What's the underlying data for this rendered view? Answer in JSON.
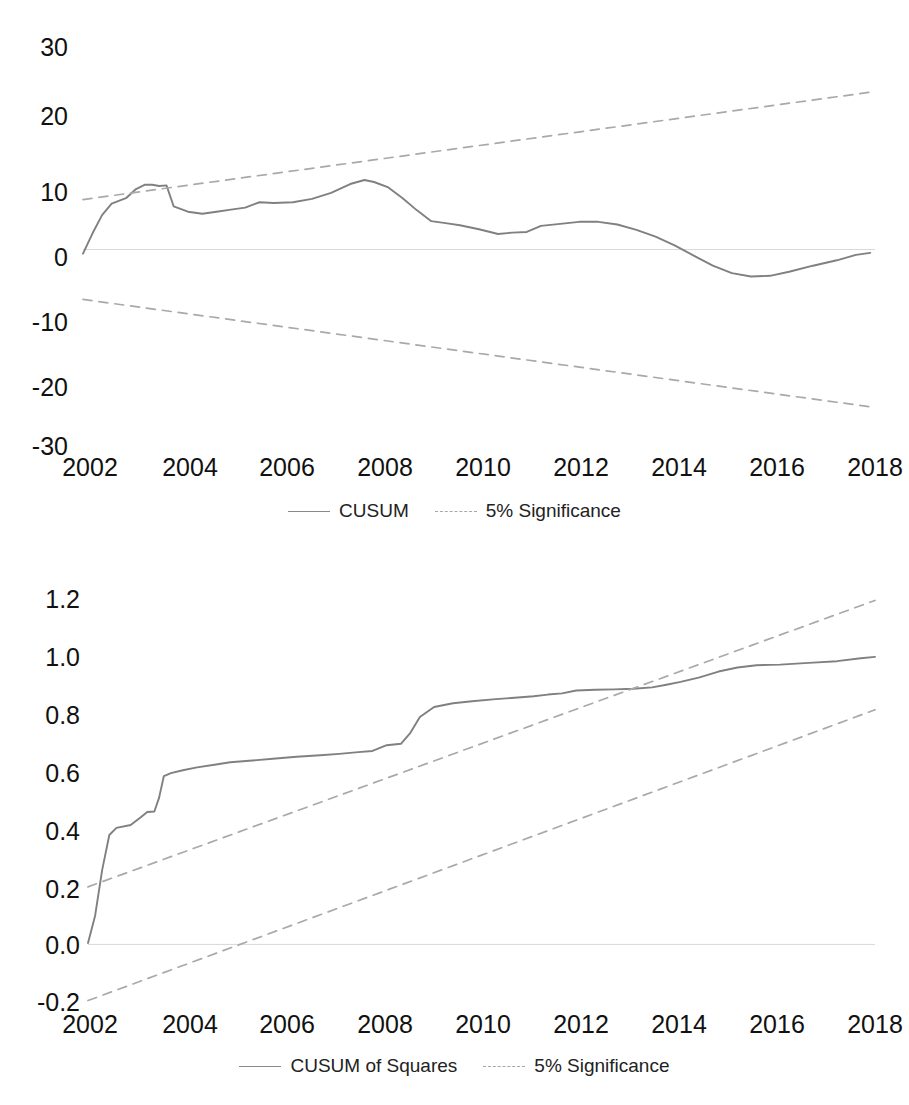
{
  "page": {
    "background": "#ffffff",
    "line_color": "#808080",
    "significance_color": "#a9a9a9",
    "zero_line_color": "#d9d9d9",
    "text_color": "#111111",
    "cropped_top_text": ""
  },
  "charts": [
    {
      "id": "cusum",
      "legend": [
        {
          "label": "CUSUM",
          "style": "solid",
          "color": "#808080"
        },
        {
          "label": "5% Significance",
          "style": "dashed",
          "color": "#a9a9a9"
        }
      ],
      "axes": {
        "y_ticks": [
          "30",
          "20",
          "10",
          "0",
          "-10",
          "-20",
          "-30"
        ],
        "x_ticks": [
          "2002",
          "2004",
          "2006",
          "2008",
          "2010",
          "2012",
          "2014",
          "2016",
          "2018"
        ]
      }
    },
    {
      "id": "cusum-of-squares",
      "legend": [
        {
          "label": "CUSUM of Squares",
          "style": "solid",
          "color": "#808080"
        },
        {
          "label": "5% Significance",
          "style": "dashed",
          "color": "#a9a9a9"
        }
      ],
      "axes": {
        "y_ticks": [
          "1.2",
          "1.0",
          "0.8",
          "0.6",
          "0.4",
          "0.2",
          "0.0",
          "-0.2"
        ],
        "x_ticks": [
          "2002",
          "2004",
          "2006",
          "2008",
          "2010",
          "2012",
          "2014",
          "2016",
          "2018"
        ]
      }
    }
  ],
  "chart_data": [
    {
      "type": "line",
      "title": "CUSUM",
      "xlabel": "",
      "ylabel": "",
      "xlim": [
        2002.0,
        2018.6
      ],
      "ylim": [
        -30,
        30
      ],
      "ytick_values": [
        30,
        20,
        10,
        0,
        -10,
        -20,
        -30
      ],
      "xtick_values": [
        2002,
        2004,
        2006,
        2008,
        2010,
        2012,
        2014,
        2016,
        2018
      ],
      "grid": false,
      "zero_line": true,
      "legend_position": "bottom",
      "series": [
        {
          "name": "CUSUM",
          "style": "solid",
          "color": "#808080",
          "x": [
            2002.0,
            2002.2,
            2002.4,
            2002.6,
            2002.9,
            2003.1,
            2003.3,
            2003.45,
            2003.6,
            2003.75,
            2003.9,
            2004.2,
            2004.5,
            2004.8,
            2005.1,
            2005.4,
            2005.7,
            2006.0,
            2006.4,
            2006.8,
            2007.2,
            2007.6,
            2007.9,
            2008.1,
            2008.4,
            2008.7,
            2009.0,
            2009.3,
            2009.6,
            2009.9,
            2010.3,
            2010.7,
            2011.0,
            2011.3,
            2011.6,
            2012.0,
            2012.4,
            2012.8,
            2013.2,
            2013.6,
            2014.0,
            2014.4,
            2014.8,
            2015.2,
            2015.6,
            2016.0,
            2016.4,
            2016.8,
            2017.3,
            2017.8,
            2018.2,
            2018.5
          ],
          "y": [
            -0.6,
            2.4,
            5.1,
            6.8,
            7.6,
            8.9,
            9.6,
            9.6,
            9.4,
            9.5,
            6.4,
            5.6,
            5.3,
            5.6,
            5.9,
            6.2,
            7.0,
            6.9,
            7.0,
            7.5,
            8.4,
            9.7,
            10.3,
            10.0,
            9.2,
            7.6,
            5.8,
            4.2,
            3.9,
            3.6,
            3.0,
            2.3,
            2.5,
            2.6,
            3.5,
            3.8,
            4.1,
            4.1,
            3.7,
            2.9,
            1.9,
            0.6,
            -0.9,
            -2.4,
            -3.5,
            -4.0,
            -3.9,
            -3.3,
            -2.4,
            -1.6,
            -0.8,
            -0.5
          ]
        },
        {
          "name": "5% Significance (upper)",
          "style": "dashed",
          "color": "#a9a9a9",
          "x": [
            2002.0,
            2018.6
          ],
          "y": [
            7.4,
            23.4
          ]
        },
        {
          "name": "5% Significance (lower)",
          "style": "dashed",
          "color": "#a9a9a9",
          "x": [
            2002.0,
            2018.6
          ],
          "y": [
            -7.4,
            -23.4
          ]
        }
      ]
    },
    {
      "type": "line",
      "title": "CUSUM of Squares",
      "xlabel": "",
      "ylabel": "",
      "xlim": [
        2002.0,
        2018.6
      ],
      "ylim": [
        -0.2,
        1.2
      ],
      "ytick_values": [
        1.2,
        1.0,
        0.8,
        0.6,
        0.4,
        0.2,
        0.0,
        -0.2
      ],
      "xtick_values": [
        2002,
        2004,
        2006,
        2008,
        2010,
        2012,
        2014,
        2016,
        2018
      ],
      "grid": false,
      "zero_line": true,
      "legend_position": "bottom",
      "series": [
        {
          "name": "CUSUM of Squares",
          "style": "solid",
          "color": "#808080",
          "x": [
            2002.0,
            2002.15,
            2002.3,
            2002.45,
            2002.6,
            2002.9,
            2003.1,
            2003.25,
            2003.4,
            2003.5,
            2003.6,
            2003.75,
            2004.0,
            2004.3,
            2004.7,
            2005.0,
            2005.4,
            2005.9,
            2006.4,
            2006.9,
            2007.3,
            2007.7,
            2008.0,
            2008.3,
            2008.6,
            2008.8,
            2009.0,
            2009.3,
            2009.7,
            2010.1,
            2010.6,
            2011.0,
            2011.4,
            2011.7,
            2012.0,
            2012.3,
            2012.7,
            2013.1,
            2013.5,
            2013.9,
            2014.2,
            2014.5,
            2014.9,
            2015.3,
            2015.7,
            2016.1,
            2016.6,
            2017.2,
            2017.8,
            2018.3,
            2018.6
          ],
          "y": [
            0.005,
            0.1,
            0.26,
            0.38,
            0.405,
            0.415,
            0.44,
            0.46,
            0.462,
            0.51,
            0.585,
            0.595,
            0.605,
            0.615,
            0.625,
            0.633,
            0.638,
            0.645,
            0.652,
            0.657,
            0.662,
            0.668,
            0.672,
            0.692,
            0.697,
            0.735,
            0.79,
            0.825,
            0.838,
            0.845,
            0.852,
            0.857,
            0.862,
            0.868,
            0.872,
            0.882,
            0.885,
            0.886,
            0.888,
            0.893,
            0.902,
            0.912,
            0.928,
            0.948,
            0.962,
            0.97,
            0.972,
            0.978,
            0.984,
            0.994,
            0.999
          ]
        },
        {
          "name": "5% Significance (upper)",
          "style": "dashed",
          "color": "#a9a9a9",
          "x": [
            2002.0,
            2018.6
          ],
          "y": [
            0.2,
            1.195
          ]
        },
        {
          "name": "5% Significance (lower)",
          "style": "dashed",
          "color": "#a9a9a9",
          "x": [
            2002.0,
            2018.6
          ],
          "y": [
            -0.195,
            0.815
          ]
        }
      ]
    }
  ]
}
